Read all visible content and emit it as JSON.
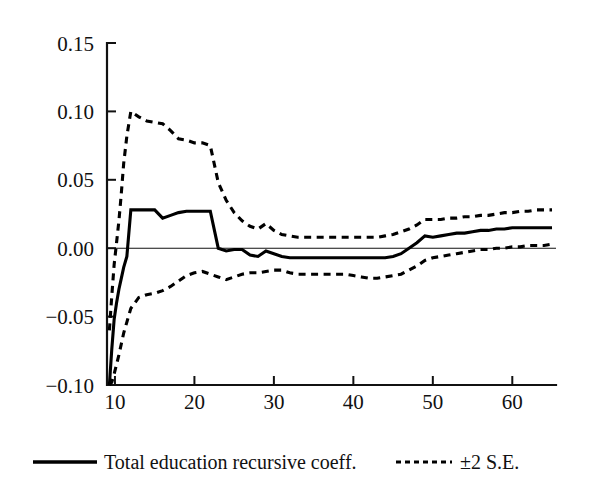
{
  "chart_data": {
    "type": "line",
    "title": "",
    "xlabel": "",
    "ylabel": "",
    "xlim": [
      9,
      65.5
    ],
    "ylim": [
      -0.1,
      0.15
    ],
    "grid": false,
    "zero_reference_line": 0.0,
    "legend_position": "below-plot",
    "y_ticks": [
      "0.15",
      "0.10",
      "0.05",
      "0.00",
      "-0.05",
      "-0.10"
    ],
    "y_tick_values": [
      0.15,
      0.1,
      0.05,
      0.0,
      -0.05,
      -0.1
    ],
    "x_ticks": [
      "10",
      "20",
      "30",
      "40",
      "50",
      "60"
    ],
    "x_tick_values": [
      10,
      20,
      30,
      40,
      50,
      60
    ],
    "x": [
      9.3,
      9.6,
      9.9,
      10.2,
      10.5,
      10.8,
      11.1,
      11.5,
      12,
      13,
      14,
      15,
      16,
      17,
      18,
      19,
      20,
      21,
      22,
      23,
      24,
      25,
      26,
      27,
      28,
      29,
      30,
      31,
      32,
      33,
      34,
      35,
      36,
      37,
      38,
      39,
      40,
      41,
      42,
      43,
      44,
      45,
      46,
      47,
      48,
      49,
      50,
      51,
      52,
      53,
      54,
      55,
      56,
      57,
      58,
      59,
      60,
      61,
      62,
      63,
      64,
      65
    ],
    "series": [
      {
        "name": "Total education recursive coeff.",
        "style": "solid",
        "values": [
          -0.1,
          -0.074,
          -0.052,
          -0.04,
          -0.03,
          -0.022,
          -0.014,
          -0.006,
          0.028,
          0.028,
          0.028,
          0.028,
          0.022,
          0.024,
          0.026,
          0.027,
          0.027,
          0.027,
          0.027,
          0.0,
          -0.002,
          -0.001,
          -0.001,
          -0.005,
          -0.006,
          -0.002,
          -0.004,
          -0.006,
          -0.007,
          -0.007,
          -0.007,
          -0.007,
          -0.007,
          -0.007,
          -0.007,
          -0.007,
          -0.007,
          -0.007,
          -0.007,
          -0.007,
          -0.007,
          -0.006,
          -0.004,
          0.0,
          0.004,
          0.009,
          0.008,
          0.009,
          0.01,
          0.011,
          0.011,
          0.012,
          0.013,
          0.013,
          0.014,
          0.014,
          0.015,
          0.015,
          0.015,
          0.015,
          0.015,
          0.015
        ]
      },
      {
        "name": "+2 S.E.",
        "style": "dashed",
        "values": [
          -0.06,
          -0.035,
          -0.012,
          0.004,
          0.02,
          0.04,
          0.062,
          0.082,
          0.1,
          0.096,
          0.093,
          0.092,
          0.091,
          0.086,
          0.08,
          0.079,
          0.077,
          0.077,
          0.075,
          0.048,
          0.035,
          0.026,
          0.02,
          0.016,
          0.014,
          0.018,
          0.013,
          0.01,
          0.009,
          0.008,
          0.008,
          0.008,
          0.008,
          0.008,
          0.008,
          0.008,
          0.008,
          0.008,
          0.008,
          0.008,
          0.009,
          0.01,
          0.012,
          0.014,
          0.017,
          0.021,
          0.021,
          0.021,
          0.022,
          0.022,
          0.023,
          0.023,
          0.024,
          0.024,
          0.025,
          0.026,
          0.026,
          0.027,
          0.027,
          0.028,
          0.028,
          0.028
        ]
      },
      {
        "name": "-2 S.E.",
        "style": "dashed",
        "values": [
          -0.1,
          -0.098,
          -0.092,
          -0.085,
          -0.078,
          -0.07,
          -0.062,
          -0.054,
          -0.044,
          -0.036,
          -0.034,
          -0.033,
          -0.031,
          -0.028,
          -0.024,
          -0.02,
          -0.018,
          -0.017,
          -0.019,
          -0.021,
          -0.023,
          -0.021,
          -0.019,
          -0.018,
          -0.018,
          -0.017,
          -0.016,
          -0.016,
          -0.018,
          -0.019,
          -0.019,
          -0.019,
          -0.019,
          -0.019,
          -0.019,
          -0.019,
          -0.02,
          -0.021,
          -0.022,
          -0.022,
          -0.021,
          -0.02,
          -0.019,
          -0.016,
          -0.013,
          -0.009,
          -0.007,
          -0.006,
          -0.005,
          -0.004,
          -0.003,
          -0.002,
          -0.001,
          -0.001,
          0.0,
          0.0,
          0.001,
          0.001,
          0.002,
          0.002,
          0.002,
          0.003
        ]
      }
    ],
    "legend": [
      {
        "label": "Total education recursive coeff.",
        "style": "solid"
      },
      {
        "label": "±2 S.E.",
        "style": "dashed"
      }
    ]
  },
  "colors": {
    "line": "#000000",
    "axis": "#111111",
    "background": "#ffffff"
  }
}
